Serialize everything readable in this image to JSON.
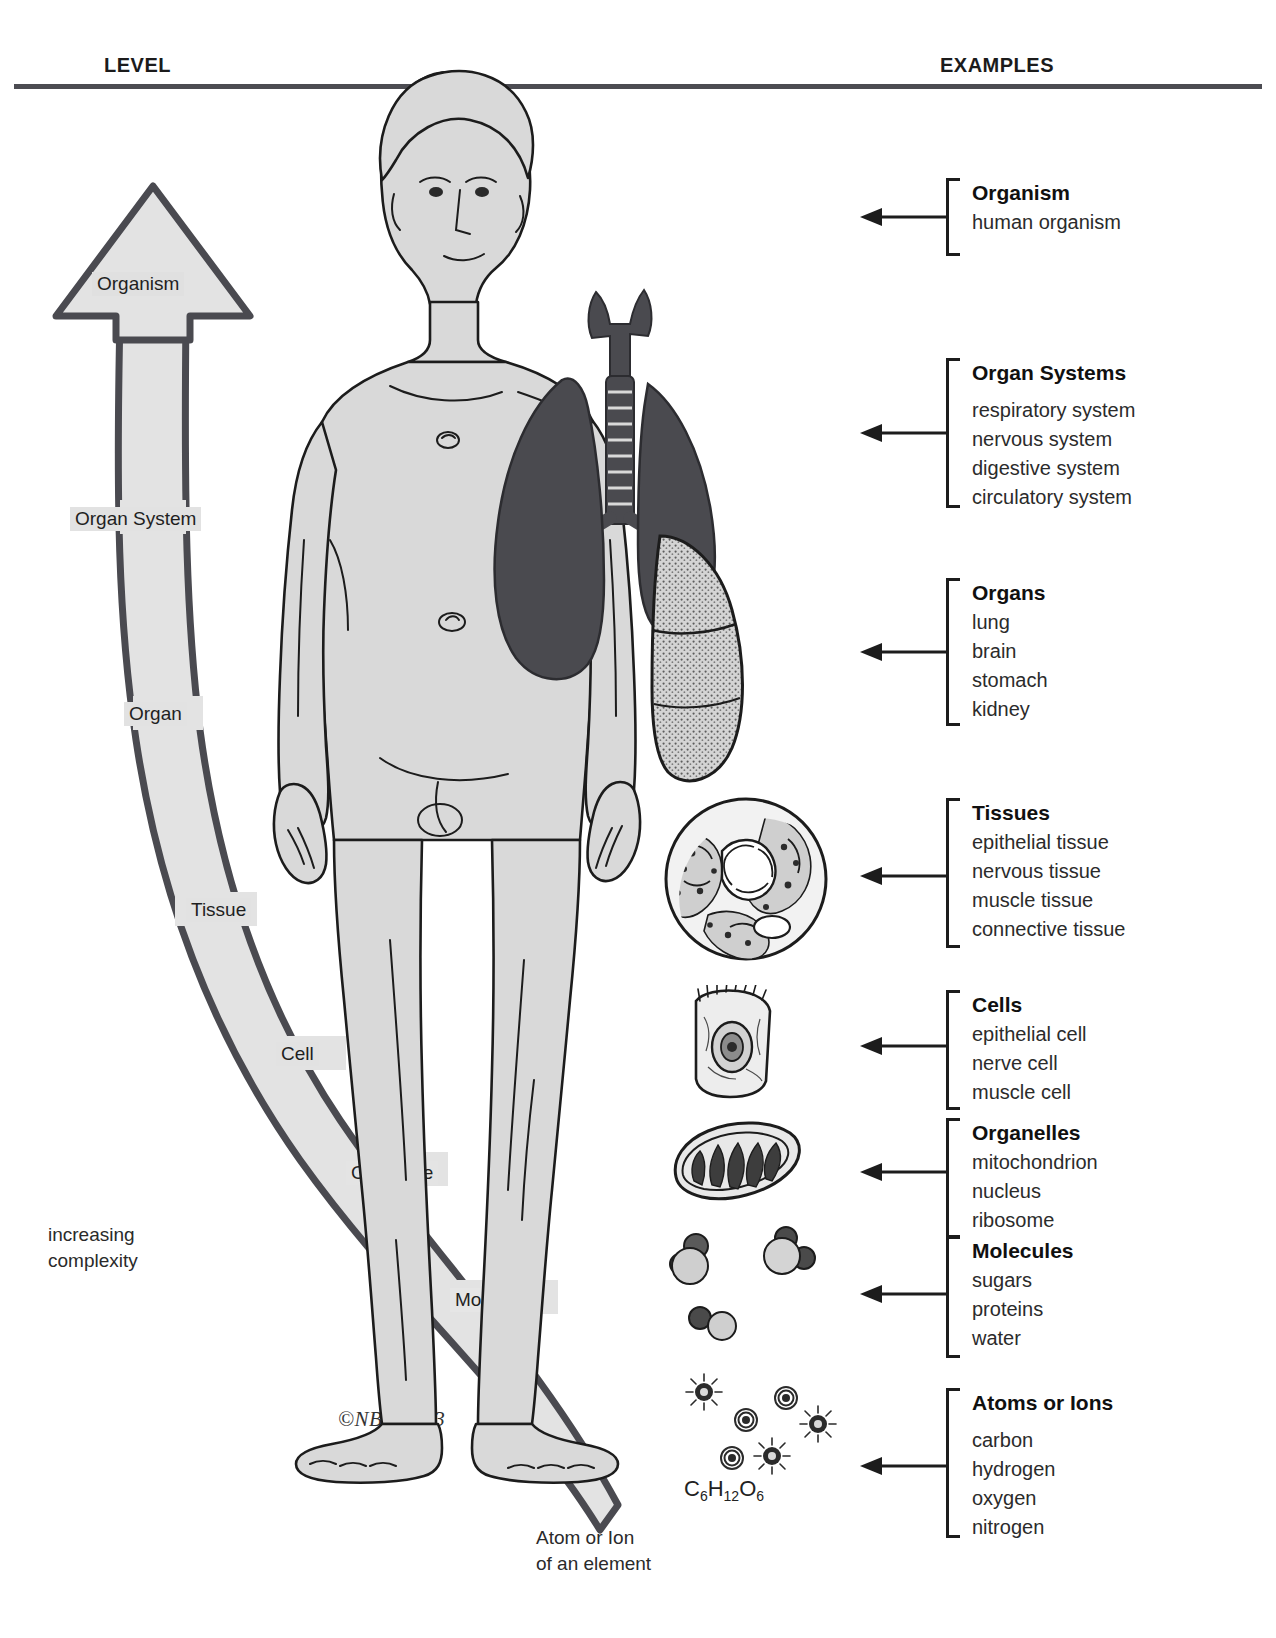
{
  "header": {
    "level_label": "LEVEL",
    "examples_label": "EXAMPLES"
  },
  "complexity_arrow": {
    "caption_line1": "increasing",
    "caption_line2": "complexity",
    "labels": [
      {
        "id": "organism",
        "text": "Organism"
      },
      {
        "id": "organ-system",
        "text": "Organ System"
      },
      {
        "id": "organ",
        "text": "Organ"
      },
      {
        "id": "tissue",
        "text": "Tissue"
      },
      {
        "id": "cell",
        "text": "Cell"
      },
      {
        "id": "organelle",
        "text": "Organelle"
      },
      {
        "id": "molecule",
        "text": "Molecule"
      }
    ],
    "bottom_caption_line1": "Atom or Ion",
    "bottom_caption_line2": "of an element",
    "fill_color": "#e3e3e3",
    "outline_color": "#4a4a50"
  },
  "figure": {
    "copyright": "©NBR,1983",
    "formula_prefix": "C",
    "formula": {
      "c": "C",
      "c_sub": "6",
      "h": "H",
      "h_sub": "12",
      "o": "O",
      "o_sub": "6"
    }
  },
  "examples": [
    {
      "id": "organism",
      "title": "Organism",
      "items": [
        "human organism"
      ]
    },
    {
      "id": "organ-systems",
      "title": "Organ Systems",
      "items": [
        "respiratory system",
        "nervous system",
        "digestive system",
        "circulatory system"
      ]
    },
    {
      "id": "organs",
      "title": "Organs",
      "items": [
        "lung",
        "brain",
        "stomach",
        "kidney"
      ]
    },
    {
      "id": "tissues",
      "title": "Tissues",
      "items": [
        "epithelial tissue",
        "nervous tissue",
        "muscle tissue",
        "connective tissue"
      ]
    },
    {
      "id": "cells",
      "title": "Cells",
      "items": [
        "epithelial cell",
        "nerve cell",
        "muscle cell"
      ]
    },
    {
      "id": "organelles",
      "title": "Organelles",
      "items": [
        "mitochondrion",
        "nucleus",
        "ribosome"
      ]
    },
    {
      "id": "molecules",
      "title": "Molecules",
      "items": [
        "sugars",
        "proteins",
        "water"
      ]
    },
    {
      "id": "atoms-or-ions",
      "title": "Atoms or Ions",
      "items": [
        "carbon",
        "hydrogen",
        "oxygen",
        "nitrogen"
      ]
    }
  ],
  "colors": {
    "rule": "#4c4c52",
    "body_fill": "#d9d9d9",
    "organ_dark": "#4a4a4f",
    "ink": "#1c1c1c"
  }
}
